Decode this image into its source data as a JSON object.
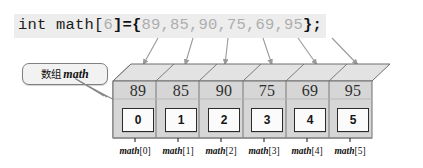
{
  "code": {
    "prefix": "int math[",
    "size": "6",
    "mid": "]={",
    "values_text": "89,85,90,75,69,95",
    "suffix": "};"
  },
  "callout": {
    "label_cn": "数组",
    "label_name": "math"
  },
  "array": {
    "name": "math",
    "length": 6,
    "values": [
      "89",
      "85",
      "90",
      "75",
      "69",
      "95"
    ],
    "indices": [
      "0",
      "1",
      "2",
      "3",
      "4",
      "5"
    ],
    "element_labels": [
      "math[0]",
      "math[1]",
      "math[2]",
      "math[3]",
      "math[4]",
      "math[5]"
    ],
    "element_label_name": "math",
    "element_label_brackets": [
      "[0]",
      "[1]",
      "[2]",
      "[3]",
      "[4]",
      "[5]"
    ]
  },
  "colors": {
    "code_bg": "#ededed",
    "code_text": "#1b1b1b",
    "code_dim": "#adadad",
    "box_front": "#d6d6d6",
    "box_top": "#e9e9e9",
    "box_side": "#c2c2c2",
    "outline": "#6e6e6e",
    "index_box_bg": "#fbfbfb",
    "index_box_border": "#2b2b2b",
    "arrow": "#9a9a9a",
    "callout_bg": "#f2f2f2",
    "callout_border": "#808080"
  }
}
